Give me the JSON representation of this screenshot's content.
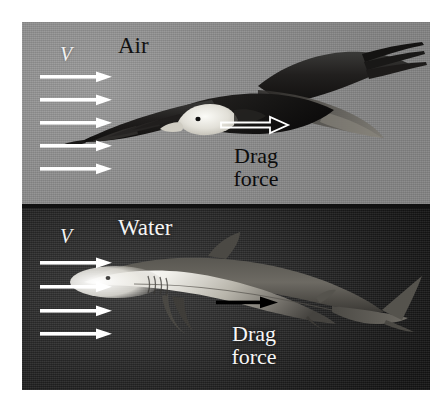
{
  "figure": {
    "background_color": "#ffffff",
    "panels": [
      {
        "id": "air",
        "medium_label": "Air",
        "velocity_label": "V",
        "drag_label_line1": "Drag",
        "drag_label_line2": "force",
        "background_color": "#8d8d8d",
        "text_color": "#111111",
        "velocity_arrow_count": 5,
        "velocity_arrow_color": "#ffffff",
        "drag_arrow_style": "outlined",
        "drag_arrow_color": "#ffffff",
        "subject": "bald-eagle"
      },
      {
        "id": "water",
        "medium_label": "Water",
        "velocity_label": "V",
        "drag_label_line1": "Drag",
        "drag_label_line2": "force",
        "background_color": "#242424",
        "text_color": "#f4f4f4",
        "velocity_arrow_count": 4,
        "velocity_arrow_color": "#ffffff",
        "drag_arrow_style": "solid",
        "drag_arrow_color": "#000000",
        "subject": "shark"
      }
    ]
  }
}
